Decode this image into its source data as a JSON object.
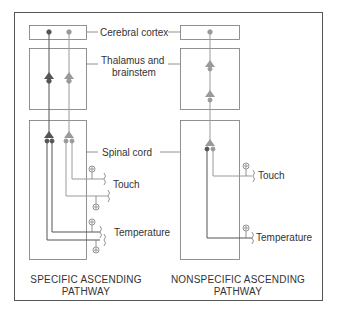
{
  "labels": {
    "cortex": "Cerebral cortex",
    "thalamus_line1": "Thalamus and",
    "thalamus_line2": "brainstem",
    "spinal": "Spinal cord",
    "touch_left": "Touch",
    "temp_left": "Temperature",
    "touch_right": "Touch",
    "temp_right": "Temperature"
  },
  "captions": {
    "left_line1": "SPECIFIC ASCENDING",
    "left_line2": "PATHWAY",
    "right_line1": "NONSPECIFIC  ASCENDING",
    "right_line2": "PATHWAY"
  },
  "colors": {
    "dark_pathway": "#555555",
    "light_pathway": "#9a9a9a",
    "frame": "#555555",
    "box": "#777777"
  },
  "pathways": [
    {
      "name": "Specific ascending pathway",
      "stages": [
        "Cerebral cortex",
        "Thalamus and brainstem",
        "Spinal cord"
      ],
      "inputs": [
        "Touch",
        "Temperature"
      ]
    },
    {
      "name": "Nonspecific ascending pathway",
      "stages": [
        "Cerebral cortex",
        "Thalamus and brainstem",
        "Spinal cord"
      ],
      "inputs": [
        "Touch",
        "Temperature"
      ]
    }
  ]
}
